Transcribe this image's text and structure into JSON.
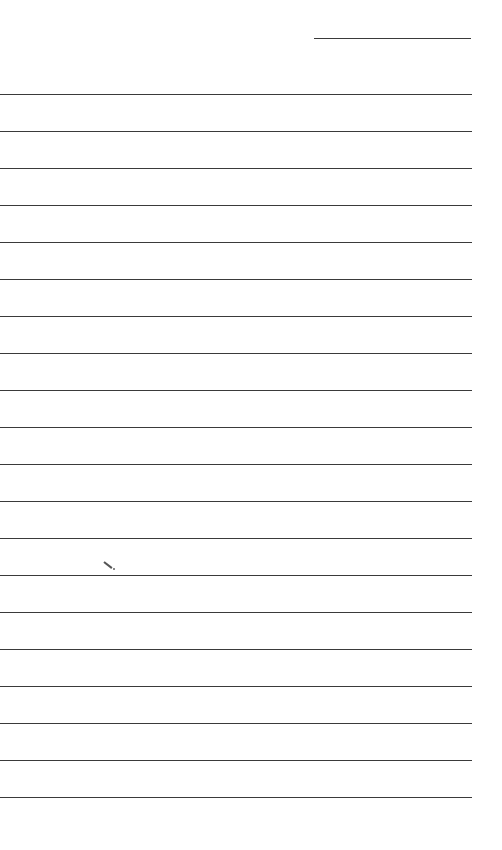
{
  "page": {
    "type": "lined-paper",
    "background": "#ffffff",
    "line_color": "#3a3a3a",
    "date_line": {
      "top": 38,
      "left": 314,
      "width": 157
    },
    "ruled_lines": {
      "count": 20,
      "first_top": 94,
      "spacing": 37,
      "left": 0,
      "width": 472
    },
    "stray_mark": {
      "x": 104,
      "y": 561
    }
  }
}
